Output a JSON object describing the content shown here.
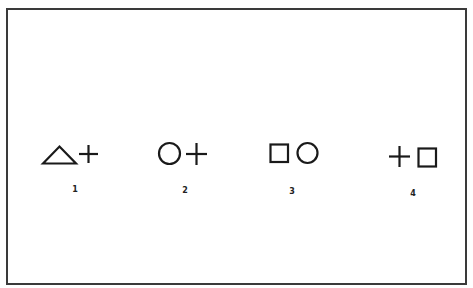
{
  "figure": {
    "stroke_color": "#1a1a1a",
    "border_color": "#3a3a3a",
    "pairs": [
      {
        "index": 0,
        "label": "1",
        "shapes": [
          "triangle",
          "plus"
        ]
      },
      {
        "index": 1,
        "label": "2",
        "shapes": [
          "circle",
          "plus"
        ]
      },
      {
        "index": 2,
        "label": "3",
        "shapes": [
          "square",
          "circle"
        ]
      },
      {
        "index": 3,
        "label": "4",
        "shapes": [
          "plus",
          "square"
        ]
      }
    ]
  }
}
